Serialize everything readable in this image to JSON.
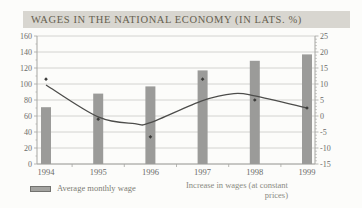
{
  "title": "WAGES IN THE NATIONAL ECONOMY (IN LATS. %)",
  "colors": {
    "page_bg": "#fcfcfa",
    "title_bg": "#d8d6d0",
    "title_text": "#665f4f",
    "bar_fill": "#9b9b99",
    "trend_line": "#4d4d4b",
    "marker": "#3c3c3a",
    "gridline": "#c9c9c5",
    "axis_line": "#a6a6a2",
    "tick_text": "#6b6b69",
    "legend_text": "#7c7c75"
  },
  "chart_data": {
    "type": "bar",
    "subtype": "combo-bar-and-smoothed-line",
    "title": "WAGES IN THE NATIONAL ECONOMY (IN LATS. %)",
    "categories": [
      "1994",
      "1995",
      "1996",
      "1997",
      "1998",
      "1999"
    ],
    "series": [
      {
        "name": "Average monthly wage",
        "type": "bar",
        "axis": "left",
        "values": [
          71,
          88,
          97,
          117,
          129,
          137
        ]
      },
      {
        "name": "Increase in wages (at constant prices)",
        "type": "scatter-with-smoothed-trend",
        "axis": "right",
        "values": [
          11.5,
          -1,
          -6.5,
          11.5,
          5,
          2.5
        ]
      }
    ],
    "trend_curve_points": [
      [
        1994,
        9.7
      ],
      [
        1995,
        -0.3
      ],
      [
        1995.7,
        -2.4
      ],
      [
        1996,
        -2.1
      ],
      [
        1997,
        4.8
      ],
      [
        1997.6,
        7.0
      ],
      [
        1998,
        6.3
      ],
      [
        1999,
        2.5
      ]
    ],
    "left_axis": {
      "min": 0,
      "max": 160,
      "step": 20,
      "ticks": [
        "160",
        "140",
        "120",
        "100",
        "80",
        "60",
        "40",
        "20",
        "0"
      ]
    },
    "right_axis": {
      "min": -15,
      "max": 25,
      "step": 5,
      "ticks": [
        "25",
        "20",
        "15",
        "10",
        "5",
        "0",
        "-5",
        "-10",
        "-15"
      ]
    },
    "grid": "horizontal",
    "legend_position": "bottom"
  },
  "legend": {
    "bar_label": "Average monthly wage",
    "line_label_line1": "Increase in wages (at constant",
    "line_label_line2": "prices)"
  }
}
